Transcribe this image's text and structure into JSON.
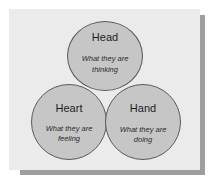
{
  "diagram": {
    "type": "three-circle venn-style diagram",
    "colors": {
      "panel_background": "#ebebeb",
      "panel_shadow": "#9e9e9e",
      "circle_fill": "#c6c6c6",
      "circle_stroke": "#5a5a5a",
      "text": "#1e1e1e"
    },
    "circles": [
      {
        "label": "Head",
        "description_line1": "What they are",
        "description_line2": "thinking"
      },
      {
        "label": "Heart",
        "description_line1": "What they are",
        "description_line2": "feeling"
      },
      {
        "label": "Hand",
        "description_line1": "What they are",
        "description_line2": "doing"
      }
    ]
  }
}
